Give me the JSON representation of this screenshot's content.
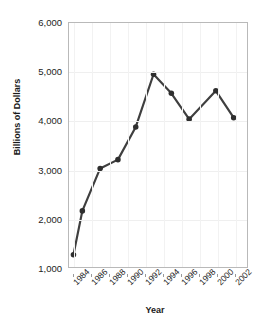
{
  "chart_data": {
    "type": "line",
    "title": "",
    "xlabel": "Year",
    "ylabel": "Billions of Dollars",
    "xlim": [
      1983.5,
      2003.5
    ],
    "ylim": [
      1000,
      6000
    ],
    "grid": true,
    "legend": null,
    "y_tick_labels": [
      "6,000",
      "5,000",
      "4,000",
      "3,000",
      "2,000",
      "1,000"
    ],
    "y_tick_values": [
      6000,
      5000,
      4000,
      3000,
      2000,
      1000
    ],
    "x_tick_labels": [
      "1984",
      "1986",
      "1988",
      "1990",
      "1992",
      "1994",
      "1996",
      "1998",
      "2000",
      "2002"
    ],
    "x_tick_values": [
      1984,
      1986,
      1988,
      1990,
      1992,
      1994,
      1996,
      1998,
      2000,
      2002
    ],
    "series": [
      {
        "name": "Billions of Dollars",
        "color": "#3f3f3f",
        "marker": "circle",
        "x": [
          1984,
          1985,
          1987,
          1989,
          1991,
          1993,
          1995,
          1997,
          2000,
          2002
        ],
        "values": [
          1250,
          2150,
          3020,
          3200,
          3870,
          4950,
          4560,
          4030,
          4610,
          4060
        ]
      }
    ],
    "colors": {
      "line": "#3f3f3f",
      "marker": "#2e2e2e",
      "grid": "#efefef",
      "frame": "#b9b9b9",
      "text": "#1d1d1d",
      "background": "#ffffff"
    }
  }
}
